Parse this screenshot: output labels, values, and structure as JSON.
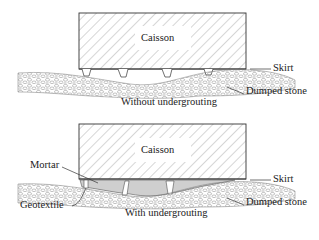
{
  "top": {
    "caisson_label": "Caisson",
    "skirt_label": "Skirt",
    "stone_label": "Dumped stone",
    "caption": "Without undergrouting"
  },
  "bottom": {
    "caisson_label": "Caisson",
    "skirt_label": "Skirt",
    "stone_label": "Dumped stone",
    "mortar_label": "Mortar",
    "geotextile_label": "Geotextile",
    "caption": "With undergrouting"
  },
  "colors": {
    "line": "#333333",
    "hatch": "#888888",
    "mortar": "#cfcfcf",
    "stone": "#9a9a9a"
  }
}
